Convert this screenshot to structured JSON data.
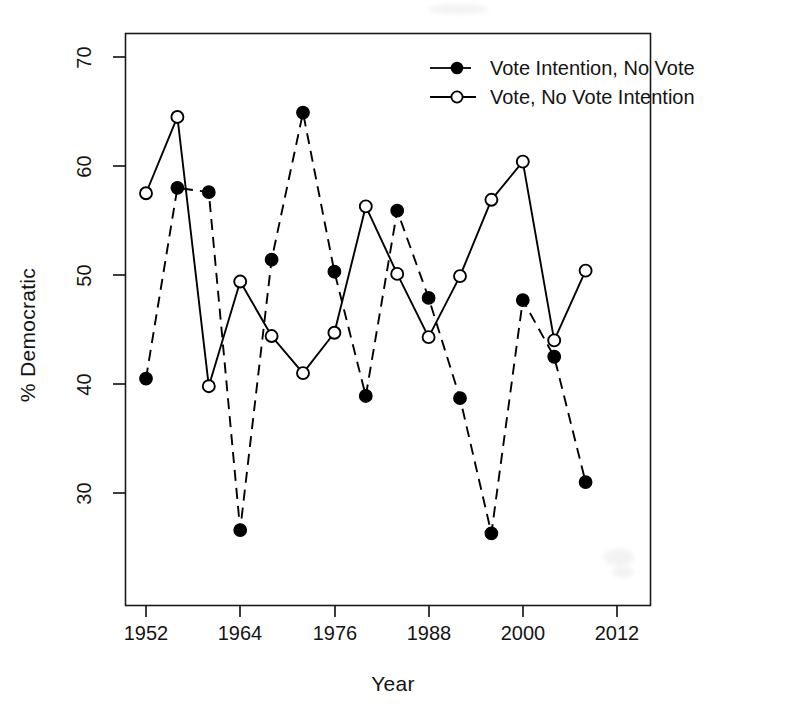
{
  "chart_data": {
    "type": "line",
    "title": "",
    "xlabel": "Year",
    "ylabel": "% Democratic",
    "xlim": [
      1948,
      2014
    ],
    "ylim": [
      25.0,
      71.5
    ],
    "xticks": [
      1952,
      1964,
      1976,
      1988,
      2000,
      2012
    ],
    "yticks": [
      30,
      40,
      50,
      60,
      70
    ],
    "grid": false,
    "legend_position": "top-right",
    "series": [
      {
        "name": "Vote Intention, No Vote",
        "marker": "filled-circle",
        "linestyle": "dashed",
        "color": "#000000",
        "x": [
          1952,
          1956,
          1960,
          1964,
          1968,
          1972,
          1976,
          1980,
          1984,
          1988,
          1992,
          1996,
          2000,
          2004,
          2008
        ],
        "values": [
          40.5,
          58.0,
          57.6,
          26.6,
          51.4,
          64.9,
          50.3,
          38.9,
          55.9,
          47.9,
          38.7,
          26.3,
          47.7,
          42.5,
          31.0
        ]
      },
      {
        "name": "Vote, No Vote Intention",
        "marker": "open-circle",
        "linestyle": "solid",
        "color": "#000000",
        "x": [
          1952,
          1956,
          1960,
          1964,
          1968,
          1972,
          1976,
          1980,
          1984,
          1988,
          1992,
          1996,
          2000,
          2004,
          2008
        ],
        "values": [
          57.5,
          64.5,
          39.8,
          49.4,
          44.4,
          41.0,
          44.7,
          56.3,
          50.1,
          44.3,
          49.9,
          56.9,
          60.4,
          44.0,
          50.4
        ]
      }
    ]
  },
  "legend": {
    "entries": [
      {
        "label": "Vote Intention, No Vote"
      },
      {
        "label": "Vote, No Vote Intention"
      }
    ]
  },
  "axes": {
    "x_title": "Year",
    "y_title": "% Democratic",
    "x_tick_labels": [
      "1952",
      "1964",
      "1976",
      "1988",
      "2000",
      "2012"
    ],
    "y_tick_labels": [
      "30",
      "40",
      "50",
      "60",
      "70"
    ]
  }
}
